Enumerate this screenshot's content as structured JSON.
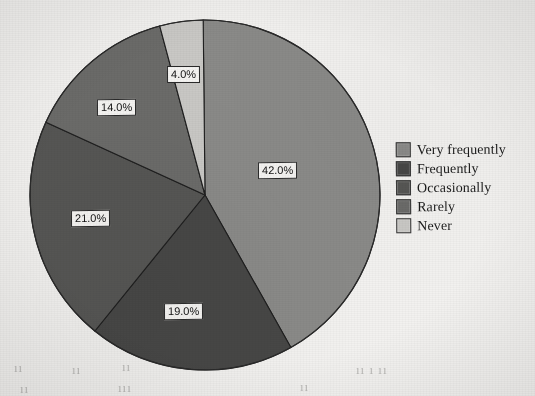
{
  "chart_data": {
    "type": "pie",
    "title": "",
    "labels": [
      "Very frequently",
      "Frequently",
      "Occasionally",
      "Rarely",
      "Never"
    ],
    "values": [
      42.0,
      19.0,
      21.0,
      14.0,
      4.0
    ],
    "value_labels": [
      "42.0%",
      "19.0%",
      "21.0%",
      "14.0%",
      "4.0%"
    ],
    "units": "percent",
    "total": 100.0,
    "start_angle_deg": 0,
    "direction": "clockwise",
    "legend_position": "right",
    "grid": false,
    "colors": [
      "#8a8a88",
      "#474746",
      "#565654",
      "#6b6b69",
      "#c9c8c5"
    ]
  },
  "legend": {
    "items": [
      {
        "label": "Very frequently",
        "color": "#8a8a88"
      },
      {
        "label": "Frequently",
        "color": "#474746"
      },
      {
        "label": "Occasionally",
        "color": "#565654"
      },
      {
        "label": "Rarely",
        "color": "#6b6b69"
      },
      {
        "label": "Never",
        "color": "#c9c8c5"
      }
    ]
  },
  "slice_labels": [
    {
      "text": "42.0%",
      "x": 258,
      "y": 162
    },
    {
      "text": "19.0%",
      "x": 164,
      "y": 303
    },
    {
      "text": "21.0%",
      "x": 71,
      "y": 210
    },
    {
      "text": "14.0%",
      "x": 97,
      "y": 99
    },
    {
      "text": "4.0%",
      "x": 167,
      "y": 66
    }
  ],
  "bleed_text": [
    {
      "text": "ıı",
      "x": 14,
      "y": 360
    },
    {
      "text": "ıı",
      "x": 72,
      "y": 362
    },
    {
      "text": "ıı",
      "x": 122,
      "y": 359
    },
    {
      "text": "ıı ı ıı",
      "x": 356,
      "y": 362
    },
    {
      "text": "ıı",
      "x": 20,
      "y": 381
    },
    {
      "text": "ııı",
      "x": 118,
      "y": 380
    },
    {
      "text": "ıı",
      "x": 300,
      "y": 379
    }
  ]
}
